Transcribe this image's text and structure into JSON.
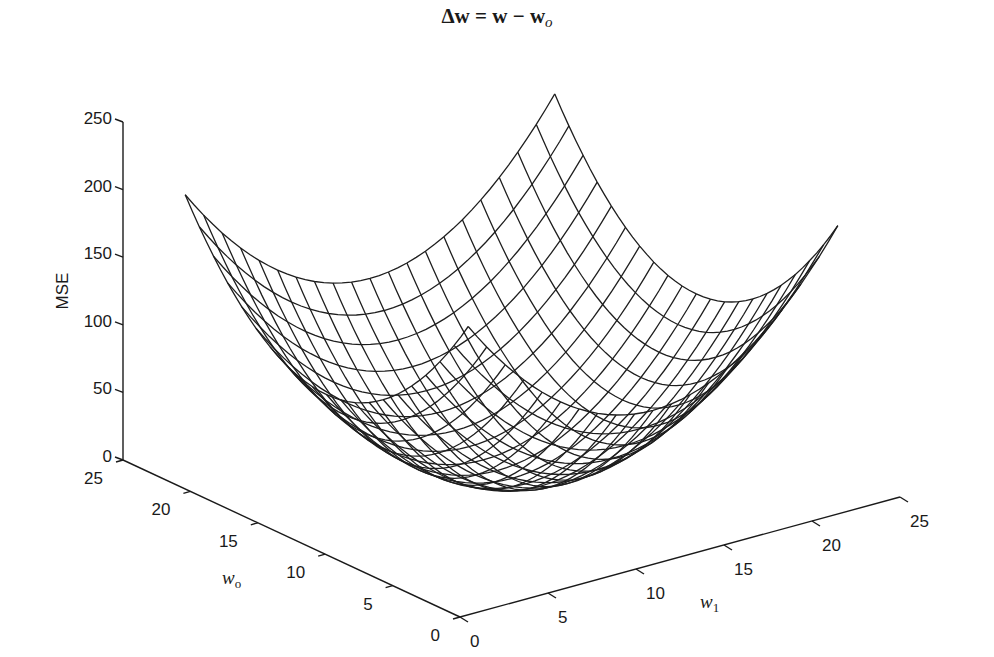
{
  "equation": {
    "lhs": "Δw",
    "eq": " = ",
    "w": "w",
    "minus": " − ",
    "w2": "w",
    "sub": "o"
  },
  "chart_data": {
    "type": "surface3d",
    "zlabel": "MSE",
    "xlabel": "w_0",
    "ylabel": "w_1",
    "zlim": [
      0,
      250
    ],
    "w0_lim": [
      0,
      25
    ],
    "w1_lim": [
      0,
      25
    ],
    "z_ticks": [
      0,
      50,
      100,
      150,
      200,
      250
    ],
    "w0_ticks": [
      0,
      5,
      10,
      15,
      20,
      25
    ],
    "w1_ticks": [
      0,
      5,
      10,
      15,
      20,
      25
    ],
    "surface": {
      "formula": "MSE = z_min + k * ((w0 - c0)^2 + (w1 - c1)^2)",
      "c0": 12.5,
      "c1": 12.5,
      "k": 0.9,
      "z_min": 0,
      "w0_range": [
        2,
        23
      ],
      "w1_range": [
        2,
        23
      ],
      "grid_lines": 21
    },
    "grid": false,
    "legend": null
  },
  "labels": {
    "z_axis_title": "MSE",
    "w0_axis_var": "w",
    "w0_axis_sub": "o",
    "w1_axis_var": "w",
    "w1_axis_sub": "1"
  },
  "colors": {
    "ink": "#1a1a1a",
    "background": "#ffffff"
  }
}
